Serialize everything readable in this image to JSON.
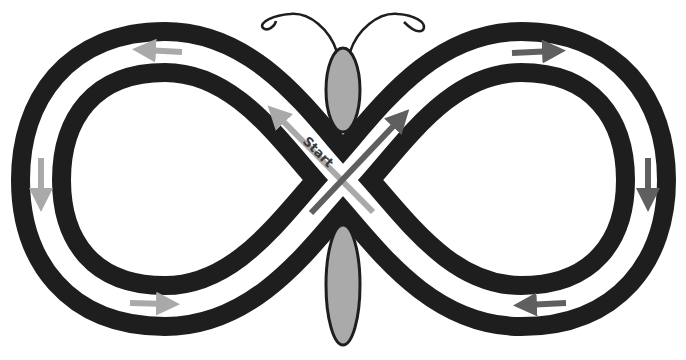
{
  "diagram": {
    "start_label": "Start",
    "colors": {
      "track": "#1e1e1e",
      "lane": "#ffffff",
      "body_fill": "#aaaaaa",
      "body_outline": "#1e1e1e",
      "arrow_light": "#a9a9a9",
      "arrow_dark": "#5f5f5f",
      "background": "#ffffff"
    },
    "arrows": [
      {
        "id": "left-top",
        "direction": "left",
        "shade": "light"
      },
      {
        "id": "left-side",
        "direction": "down",
        "shade": "light"
      },
      {
        "id": "left-bottom",
        "direction": "right",
        "shade": "light"
      },
      {
        "id": "right-top",
        "direction": "right",
        "shade": "dark"
      },
      {
        "id": "right-side",
        "direction": "down",
        "shade": "dark"
      },
      {
        "id": "right-bottom",
        "direction": "left",
        "shade": "dark"
      },
      {
        "id": "center-start",
        "direction": "up-left",
        "shade": "light"
      },
      {
        "id": "center-cross",
        "direction": "up-right",
        "shade": "dark"
      }
    ]
  }
}
